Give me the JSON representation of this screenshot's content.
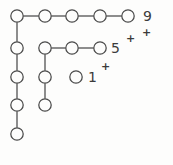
{
  "diagram": {
    "title": "",
    "style": {
      "background": "#fdfdfc",
      "stroke": "#4a4a4a",
      "node_fill": "#fdfdfc",
      "text_color": "#3b3b3b",
      "node_radius": 6.2,
      "stroke_width": 1.25
    },
    "nodes": [
      {
        "id": "r1c1",
        "cx": 17,
        "cy": 16,
        "row": 1,
        "col": 1
      },
      {
        "id": "r1c2",
        "cx": 45,
        "cy": 16,
        "row": 1,
        "col": 2
      },
      {
        "id": "r1c3",
        "cx": 72,
        "cy": 16,
        "row": 1,
        "col": 3
      },
      {
        "id": "r1c4",
        "cx": 100,
        "cy": 16,
        "row": 1,
        "col": 4
      },
      {
        "id": "r1c5",
        "cx": 128,
        "cy": 16,
        "row": 1,
        "col": 5
      },
      {
        "id": "r2c1",
        "cx": 17,
        "cy": 48,
        "row": 2,
        "col": 1
      },
      {
        "id": "r2c2",
        "cx": 45,
        "cy": 48,
        "row": 2,
        "col": 2
      },
      {
        "id": "r2c3",
        "cx": 72,
        "cy": 48,
        "row": 2,
        "col": 3
      },
      {
        "id": "r2c4",
        "cx": 100,
        "cy": 48,
        "row": 2,
        "col": 4
      },
      {
        "id": "r3c1",
        "cx": 17,
        "cy": 77,
        "row": 3,
        "col": 1
      },
      {
        "id": "r3c2",
        "cx": 45,
        "cy": 77,
        "row": 3,
        "col": 2
      },
      {
        "id": "r3c3",
        "cx": 76,
        "cy": 77,
        "row": 3,
        "col": 3
      },
      {
        "id": "r4c1",
        "cx": 17,
        "cy": 105,
        "row": 4,
        "col": 1
      },
      {
        "id": "r4c2",
        "cx": 45,
        "cy": 105,
        "row": 4,
        "col": 2
      },
      {
        "id": "r5c1",
        "cx": 17,
        "cy": 134,
        "row": 5,
        "col": 1
      }
    ],
    "edges": [
      {
        "id": "e-top-1",
        "from": "r1c1",
        "to": "r1c2",
        "orientation": "horizontal"
      },
      {
        "id": "e-top-2",
        "from": "r1c2",
        "to": "r1c3",
        "orientation": "horizontal"
      },
      {
        "id": "e-top-3",
        "from": "r1c3",
        "to": "r1c4",
        "orientation": "horizontal"
      },
      {
        "id": "e-top-4",
        "from": "r1c4",
        "to": "r1c5",
        "orientation": "horizontal"
      },
      {
        "id": "e-mid-1",
        "from": "r2c2",
        "to": "r2c3",
        "orientation": "horizontal"
      },
      {
        "id": "e-mid-2",
        "from": "r2c3",
        "to": "r2c4",
        "orientation": "horizontal"
      },
      {
        "id": "e-col1-1",
        "from": "r1c1",
        "to": "r2c1",
        "orientation": "vertical"
      },
      {
        "id": "e-col1-2",
        "from": "r2c1",
        "to": "r3c1",
        "orientation": "vertical"
      },
      {
        "id": "e-col1-3",
        "from": "r3c1",
        "to": "r4c1",
        "orientation": "vertical"
      },
      {
        "id": "e-col1-4",
        "from": "r4c1",
        "to": "r5c1",
        "orientation": "vertical"
      },
      {
        "id": "e-col2-1",
        "from": "r2c2",
        "to": "r3c2",
        "orientation": "vertical"
      },
      {
        "id": "e-col2-2",
        "from": "r3c2",
        "to": "r4c2",
        "orientation": "vertical"
      }
    ],
    "labels": [
      {
        "id": "label-9",
        "text": "9",
        "x": 143,
        "y": 9,
        "kind": "main"
      },
      {
        "id": "label-9-charge",
        "text": "+",
        "x": 142,
        "y": 27,
        "kind": "charge"
      },
      {
        "id": "label-5",
        "text": "5",
        "x": 111,
        "y": 41,
        "kind": "main"
      },
      {
        "id": "label-5-charge",
        "text": "+",
        "x": 126,
        "y": 33,
        "kind": "charge"
      },
      {
        "id": "label-1",
        "text": "1",
        "x": 88,
        "y": 70,
        "kind": "main"
      },
      {
        "id": "label-1-charge",
        "text": "+",
        "x": 101,
        "y": 61,
        "kind": "charge"
      }
    ]
  }
}
